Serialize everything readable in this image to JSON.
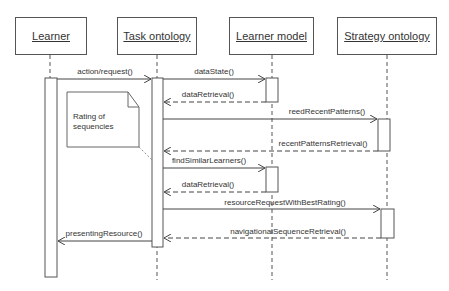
{
  "diagram": {
    "type": "uml-sequence-diagram",
    "lifelines": [
      {
        "id": "learner",
        "label": "Learner"
      },
      {
        "id": "task",
        "label": "Task ontology"
      },
      {
        "id": "learner_model",
        "label": "Learner model"
      },
      {
        "id": "strategy",
        "label": "Strategy ontology"
      }
    ],
    "note": {
      "text_line1": "Rating of",
      "text_line2": "sequencies"
    },
    "messages": [
      {
        "from": "learner",
        "to": "task",
        "label": "action/request()",
        "kind": "call"
      },
      {
        "from": "task",
        "to": "learner_model",
        "label": "dataState()",
        "kind": "call"
      },
      {
        "from": "learner_model",
        "to": "task",
        "label": "dataRetrieval()",
        "kind": "return"
      },
      {
        "from": "task",
        "to": "strategy",
        "label": "reedRecentPatterns()",
        "kind": "call"
      },
      {
        "from": "strategy",
        "to": "task",
        "label": "recentPatternsRetrieval()",
        "kind": "return"
      },
      {
        "from": "task",
        "to": "learner_model",
        "label": "findSimilarLearners()",
        "kind": "call"
      },
      {
        "from": "learner_model",
        "to": "task",
        "label": "dataRetrieval()",
        "kind": "return"
      },
      {
        "from": "task",
        "to": "strategy",
        "label": "resourceRequestWithBestRating()",
        "kind": "call"
      },
      {
        "from": "strategy",
        "to": "task",
        "label": "navigationalSequenceRetrieval()",
        "kind": "return"
      },
      {
        "from": "task",
        "to": "learner",
        "label": "presentingResource()",
        "kind": "call"
      }
    ]
  }
}
